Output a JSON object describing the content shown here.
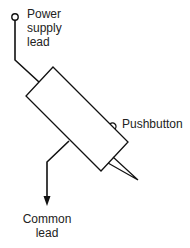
{
  "diagram": {
    "labels": {
      "power_supply_lead": [
        "Power",
        "supply",
        "lead"
      ],
      "pushbutton": "Pushbutton",
      "common_lead": [
        "Common",
        "lead"
      ]
    },
    "colors": {
      "line": "#111111",
      "text": "#222222",
      "background": "#ffffff"
    }
  }
}
